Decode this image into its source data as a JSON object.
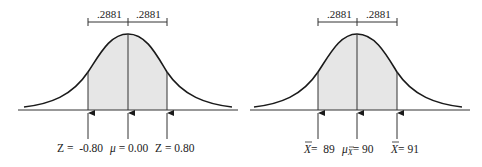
{
  "colors": {
    "curve": "#1a1a1a",
    "shade": "#e6e6e6",
    "line": "#333333",
    "text": "#222222"
  },
  "panels": [
    {
      "name": "z-distribution",
      "bracket_labels": [
        ".2881",
        ".2881"
      ],
      "markers": [
        {
          "label": "Z =  -0.80",
          "position": "left"
        },
        {
          "label": "μ = 0.00",
          "position": "center"
        },
        {
          "label": "Z = 0.80",
          "position": "right"
        }
      ]
    },
    {
      "name": "sample-mean-distribution",
      "bracket_labels": [
        ".2881",
        ".2881"
      ],
      "markers": [
        {
          "label_symbol": "X̄",
          "label_value": "=  89",
          "position": "left"
        },
        {
          "label_symbol": "μ",
          "label_sub": "X̄",
          "label_value": "= 90",
          "position": "center"
        },
        {
          "label_symbol": "X̄",
          "label_value": "= 91",
          "position": "right"
        }
      ]
    }
  ]
}
